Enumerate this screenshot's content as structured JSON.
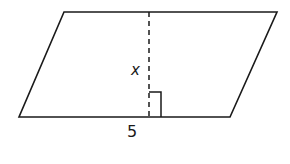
{
  "figure": {
    "shape": "parallelogram",
    "height_label": "x",
    "base_label": "5",
    "colors": {
      "stroke": "#1a1a1a",
      "background": "#ffffff"
    }
  }
}
